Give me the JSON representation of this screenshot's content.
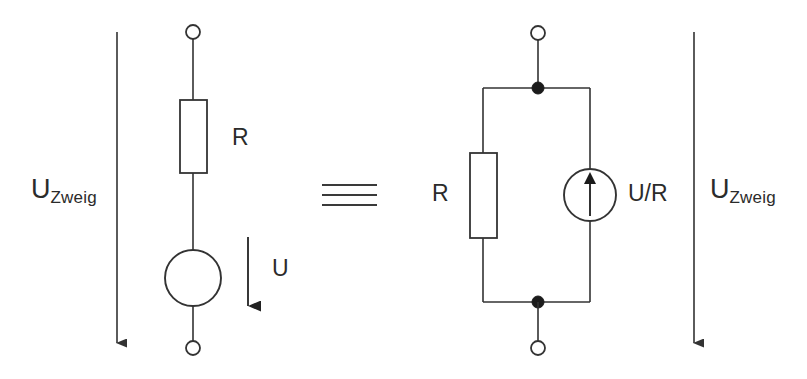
{
  "figure": {
    "kind": "electrical-circuit-equivalence-diagram",
    "background_color": "#ffffff",
    "line_color": "#333333",
    "text_color": "#2b2b2b"
  },
  "equivalence_symbol": {
    "glyph": "identical-to",
    "label": "≡",
    "line_count": 3
  },
  "left_circuit": {
    "name": "voltage-source-branch",
    "branch_voltage_label": {
      "base": "U",
      "subscript": "Zweig"
    },
    "resistor_label": "R",
    "source_voltage_label": "U",
    "terminals": [
      "top-open-terminal",
      "bottom-open-terminal"
    ],
    "components": [
      {
        "type": "resistor",
        "label": "R"
      },
      {
        "type": "voltage-source",
        "label": "U"
      }
    ]
  },
  "right_circuit": {
    "name": "current-source-branch",
    "branch_voltage_label": {
      "base": "U",
      "subscript": "Zweig"
    },
    "resistor_label": "R",
    "source_current_label": "U/R",
    "terminals": [
      "top-open-terminal",
      "bottom-open-terminal"
    ],
    "nodes": [
      "top-junction-node",
      "bottom-junction-node"
    ],
    "components": [
      {
        "type": "resistor",
        "label": "R"
      },
      {
        "type": "current-source",
        "label": "U/R",
        "arrow_direction": "up"
      }
    ]
  }
}
